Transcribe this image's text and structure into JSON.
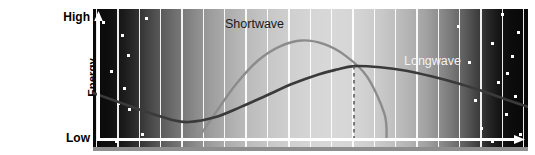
{
  "axes": {
    "y_title_lines": [
      "Energy",
      "Absorbed and Emitted",
      "at Earth's Surface"
    ],
    "y_tick_high": "High",
    "y_tick_low": "Low"
  },
  "series_labels": {
    "shortwave": "Shortwave",
    "longwave": "Longwave"
  },
  "colors": {
    "shortwave_curve": "#8c8c8c",
    "longwave_curve": "#3a3a3a",
    "axis_arrow": "#ffffff",
    "gridline": "#ffffff",
    "star": "#ffffff",
    "night_dark": "#0a0a0a",
    "day_light": "#d8d8d8",
    "dashed_marker": "#555555"
  },
  "chart_data": {
    "type": "line",
    "title": "",
    "xlabel": "",
    "ylabel": "Energy Absorbed and Emitted at Earth's Surface",
    "x": [
      0,
      5,
      10,
      15,
      20,
      24,
      30,
      35,
      40,
      45,
      50,
      55,
      60,
      65,
      70,
      75,
      80,
      85,
      90,
      95,
      100
    ],
    "ylim": [
      0,
      100
    ],
    "xlim": [
      0,
      100
    ],
    "ytick_labels": [
      "Low",
      "High"
    ],
    "ytick_positions": [
      0,
      100
    ],
    "grid": true,
    "gridline_count": 21,
    "legend": "inline-labels",
    "annotations": [
      {
        "name": "crossover-dashed-line",
        "x": 60,
        "y_from": 0,
        "y_to": 63,
        "style": "dashed"
      }
    ],
    "series": [
      {
        "name": "Shortwave",
        "color": "#8c8c8c",
        "comment": "Solar shortwave radiation: zero at night, rises after sunrise, peaks at solar noon, returns to zero at sunset",
        "x": [
          24,
          28,
          33,
          38,
          43,
          48,
          53,
          58,
          63,
          67,
          67.5
        ],
        "values": [
          0,
          22,
          48,
          68,
          80,
          85,
          82,
          72,
          54,
          22,
          0
        ]
      },
      {
        "name": "Longwave",
        "color": "#3a3a3a",
        "comment": "Terrestrial longwave emission: declines overnight to a dawn minimum, rises through the day to an afternoon peak, then declines again",
        "x": [
          0,
          6,
          12,
          18,
          22,
          28,
          34,
          40,
          46,
          52,
          56,
          60,
          66,
          72,
          78,
          84,
          90,
          96,
          100
        ],
        "values": [
          40,
          32,
          24,
          17,
          15,
          19,
          28,
          38,
          48,
          56,
          60,
          63,
          62,
          59,
          54,
          48,
          41,
          33,
          28
        ]
      }
    ]
  },
  "stars": {
    "left_night": [
      {
        "x": 9,
        "y": 12
      },
      {
        "x": 17,
        "y": 61
      },
      {
        "x": 28,
        "y": 25
      },
      {
        "x": 30,
        "y": 78
      },
      {
        "x": 22,
        "y": 131
      },
      {
        "x": 34,
        "y": 45
      },
      {
        "x": 35,
        "y": 99
      },
      {
        "x": 48,
        "y": 124
      },
      {
        "x": 52,
        "y": 8
      },
      {
        "x": 24,
        "y": 93
      }
    ],
    "right_night": [
      {
        "x": 364,
        "y": 16
      },
      {
        "x": 375,
        "y": 52
      },
      {
        "x": 381,
        "y": 90
      },
      {
        "x": 387,
        "y": 118
      },
      {
        "x": 398,
        "y": 33
      },
      {
        "x": 404,
        "y": 72
      },
      {
        "x": 398,
        "y": 131
      },
      {
        "x": 408,
        "y": 4
      },
      {
        "x": 412,
        "y": 104
      },
      {
        "x": 418,
        "y": 46
      },
      {
        "x": 421,
        "y": 86
      },
      {
        "x": 424,
        "y": 22
      },
      {
        "x": 426,
        "y": 124
      },
      {
        "x": 413,
        "y": 63
      }
    ]
  }
}
